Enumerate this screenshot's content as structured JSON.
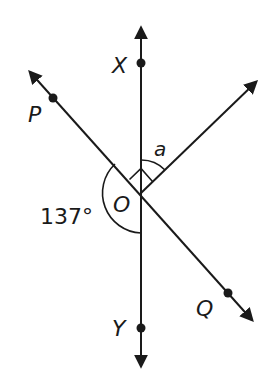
{
  "diagram": {
    "type": "angles-at-a-point",
    "center_point": "O",
    "labels": {
      "X": "X",
      "Y": "Y",
      "P": "P",
      "Q": "Q",
      "O": "O",
      "a": "a",
      "angle_value": "137°"
    },
    "lines": [
      {
        "name": "line XY",
        "through": [
          "X",
          "O",
          "Y"
        ],
        "direction": "vertical"
      },
      {
        "name": "line PQ",
        "through": [
          "P",
          "O",
          "Q"
        ],
        "direction": "diagonal"
      },
      {
        "name": "ray from O",
        "direction": "up-right"
      }
    ],
    "angle_marks": [
      {
        "name": "right-angle",
        "between": [
          "OP",
          "up-right ray"
        ],
        "mark": "square"
      },
      {
        "name": "a",
        "between": [
          "OX",
          "up-right ray"
        ],
        "mark": "arc"
      },
      {
        "name": "137°",
        "between": [
          "OP",
          "OY"
        ],
        "mark": "arc",
        "side": "left"
      }
    ],
    "colors": {
      "stroke": "#1a1a1a",
      "background": "#ffffff"
    }
  }
}
